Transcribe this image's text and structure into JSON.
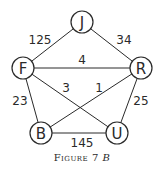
{
  "figure": {
    "caption_prefix": "Figure 7",
    "caption_suffix": "B"
  },
  "nodes": [
    {
      "id": "J",
      "label": "J",
      "x": 82,
      "y": 22
    },
    {
      "id": "F",
      "label": "F",
      "x": 23,
      "y": 68
    },
    {
      "id": "R",
      "label": "R",
      "x": 141,
      "y": 68
    },
    {
      "id": "B",
      "label": "B",
      "x": 41,
      "y": 133
    },
    {
      "id": "U",
      "label": "U",
      "x": 117,
      "y": 133
    }
  ],
  "edges": [
    {
      "from": "F",
      "to": "J",
      "weight": "125",
      "lx": 40,
      "ly": 40
    },
    {
      "from": "J",
      "to": "R",
      "weight": "34",
      "lx": 124,
      "ly": 40
    },
    {
      "from": "F",
      "to": "R",
      "weight": "4",
      "lx": 82,
      "ly": 60
    },
    {
      "from": "F",
      "to": "U",
      "weight": "3",
      "lx": 66,
      "ly": 88
    },
    {
      "from": "R",
      "to": "B",
      "weight": "1",
      "lx": 99,
      "ly": 88
    },
    {
      "from": "F",
      "to": "B",
      "weight": "23",
      "lx": 20,
      "ly": 101
    },
    {
      "from": "R",
      "to": "U",
      "weight": "25",
      "lx": 141,
      "ly": 101
    },
    {
      "from": "B",
      "to": "U",
      "weight": "145",
      "lx": 82,
      "ly": 143
    }
  ],
  "node_radius": 11,
  "colors": {
    "ink": "#2a2a2a",
    "background": "#ffffff"
  }
}
